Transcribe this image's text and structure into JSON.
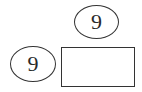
{
  "diagram": {
    "top_circle": {
      "label": "9"
    },
    "left_circle": {
      "label": "9"
    },
    "answer_box": {
      "value": ""
    }
  },
  "colors": {
    "stroke": "#333333",
    "text": "#2a2a2a",
    "background": "#ffffff"
  }
}
